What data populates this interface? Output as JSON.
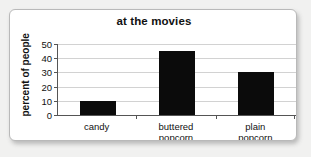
{
  "chart_data": {
    "type": "bar",
    "title": "at the movies",
    "xlabel": "",
    "ylabel": "percent of people",
    "categories": [
      "candy",
      "buttered popcorn",
      "plain popcorn"
    ],
    "category_lines": [
      [
        "candy"
      ],
      [
        "buttered",
        "popcorn"
      ],
      [
        "plain",
        "popcorn"
      ]
    ],
    "values": [
      10,
      45,
      30
    ],
    "ylim": [
      0,
      50
    ],
    "yticks": [
      0,
      10,
      20,
      30,
      40,
      50
    ],
    "ytick_labels": [
      "0",
      "10",
      "20",
      "30",
      "40",
      "50"
    ],
    "grid": true,
    "legend": false,
    "bar_color": "#0b0b0b",
    "gridline_color": "#d2d2d2",
    "axis_color": "#555555",
    "background_color": "#ffffff",
    "page_background_color": "#f1f1f0"
  }
}
